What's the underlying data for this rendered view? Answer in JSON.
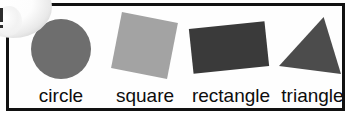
{
  "card": {
    "title": "shapes-flashcard",
    "border_color": "#111111",
    "background_color": "#fefefe"
  },
  "shapes": [
    {
      "name": "circle",
      "label": "circle",
      "type": "circle",
      "fill": "#6e6e6e",
      "rotation_deg": 0
    },
    {
      "name": "square",
      "label": "square",
      "type": "square",
      "fill": "#a3a3a3",
      "rotation_deg": 11
    },
    {
      "name": "rectangle",
      "label": "rectangle",
      "type": "rectangle",
      "fill": "#3a3a3a",
      "rotation_deg": -6
    },
    {
      "name": "triangle",
      "label": "triangle",
      "type": "triangle",
      "fill": "#4c4c4c",
      "rotation_deg": 0
    }
  ],
  "artifact": {
    "name": "corner-gloss-blob",
    "color": "#ffffff"
  }
}
